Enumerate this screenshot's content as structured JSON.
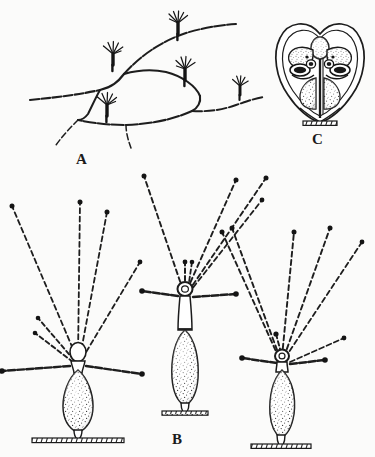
{
  "figure": {
    "kind": "scientific-illustration",
    "medium": "ink-line-drawing-stipple",
    "background_color": "#fbfbfa",
    "ink_color": "#1a1a1a",
    "width": 375,
    "height": 457
  },
  "panels": [
    {
      "id": "A",
      "label": "A",
      "label_x": 76,
      "label_y": 152,
      "caption_position": "below-center",
      "content": "branching stolon network bearing five small polyps",
      "polyp_count": 5,
      "polyps": [
        {
          "x": 178,
          "y": 22,
          "size": 1.0,
          "tentacles": 6
        },
        {
          "x": 113,
          "y": 53,
          "size": 1.0,
          "tentacles": 6
        },
        {
          "x": 185,
          "y": 68,
          "size": 1.0,
          "tentacles": 6
        },
        {
          "x": 107,
          "y": 104,
          "size": 1.0,
          "tentacles": 6
        },
        {
          "x": 240,
          "y": 85,
          "size": 0.8,
          "tentacles": 5
        }
      ],
      "stolon_description": "angular anastomosing hydrorhiza filaments with free tapering ends"
    },
    {
      "id": "B",
      "label": "B",
      "label_x": 172,
      "label_y": 432,
      "caption_position": "below-center",
      "content": "three solitary stalked polyps with radiating beaded tentacles on substrate",
      "polyp_count": 3,
      "polyps": [
        {
          "name": "left-polyp",
          "base_x": 78,
          "base_y": 432,
          "body_top_y": 358,
          "body_bottom_y": 424,
          "body_width": 26,
          "head_style": "rounded-hypostome",
          "tentacle_count": 8,
          "substrate_width": 92
        },
        {
          "name": "center-polyp",
          "base_x": 185,
          "base_y": 414,
          "body_top_y": 330,
          "body_bottom_y": 404,
          "body_width": 23,
          "head_style": "ring-hypostome",
          "tentacle_count": 8,
          "substrate_width": 46
        },
        {
          "name": "right-polyp",
          "base_x": 281,
          "base_y": 446,
          "body_top_y": 366,
          "body_bottom_y": 436,
          "body_width": 25,
          "head_style": "ring-hypostome",
          "tentacle_count": 9,
          "substrate_width": 60
        }
      ],
      "tentacle_style": "dashed-beaded-with-dark-terminal-knob"
    },
    {
      "id": "C",
      "label": "C",
      "label_x": 312,
      "label_y": 132,
      "caption_position": "below-center",
      "content": "ovoid cordate capsule enclosing a stalked gonophore with lateral lobes",
      "capsule": {
        "center_x": 320,
        "center_y": 77,
        "radius_x": 42,
        "radius_y": 46,
        "shape": "heart-ovoid-double-walled"
      },
      "pedestal": {
        "x": 320,
        "y": 122,
        "width": 34
      }
    }
  ]
}
